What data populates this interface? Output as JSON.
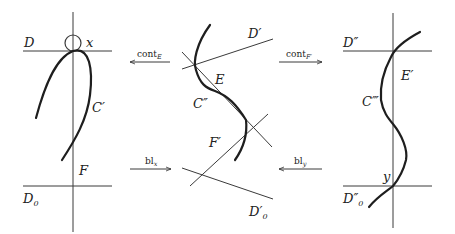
{
  "diagram": {
    "panels": [
      {
        "id": "left",
        "labels": {
          "D": "D",
          "x": "x",
          "C": "C′",
          "F": "F",
          "D0": "D",
          "D0_sub": "0"
        }
      },
      {
        "id": "middle",
        "labels": {
          "D": "D′",
          "E": "E",
          "C": "C″",
          "F": "F′",
          "D0": "D′",
          "D0_sub": "0"
        }
      },
      {
        "id": "right",
        "labels": {
          "D": "D″",
          "E": "E′",
          "C": "C‴",
          "y": "y",
          "D0": "D″",
          "D0_sub": "0"
        }
      }
    ],
    "arrows": [
      {
        "id": "cont-E",
        "label": "cont",
        "sub": "E",
        "direction": "left"
      },
      {
        "id": "cont-F",
        "label": "cont",
        "sub": "F′",
        "direction": "right"
      },
      {
        "id": "bl-x",
        "label": "bl",
        "sub": "x",
        "direction": "right"
      },
      {
        "id": "bl-y",
        "label": "bl",
        "sub": "y",
        "direction": "left"
      }
    ]
  }
}
